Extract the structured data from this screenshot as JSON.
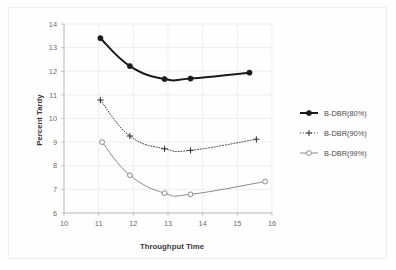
{
  "chart_data": {
    "type": "line",
    "title": "",
    "xlabel": "Throughput Time",
    "ylabel": "Percent Tardy",
    "xlim": [
      10,
      16
    ],
    "ylim": [
      6,
      14
    ],
    "xticks": [
      10,
      11,
      12,
      13,
      14,
      15,
      16
    ],
    "yticks": [
      6,
      7,
      8,
      9,
      10,
      11,
      12,
      13,
      14
    ],
    "xtick_labels": [
      "10",
      "11",
      "12",
      "13",
      "14",
      "15",
      "16"
    ],
    "ytick_labels": [
      "6",
      "7",
      "8",
      "9",
      "10",
      "11",
      "12",
      "13",
      "14"
    ],
    "grid": true,
    "legend_position": "right",
    "series": [
      {
        "name": "B-DBR(80%)",
        "marker": "filled-diamond",
        "linestyle": "solid",
        "color": "#1a1a1a",
        "linewidth": 2.0,
        "x": [
          11.05,
          11.9,
          12.9,
          13.65,
          15.35
        ],
        "y": [
          13.4,
          12.22,
          11.67,
          11.69,
          11.94
        ]
      },
      {
        "name": "B-DBR(90%)",
        "marker": "plus",
        "linestyle": "dotted",
        "color": "#3d3d3d",
        "linewidth": 1.0,
        "x": [
          11.05,
          11.9,
          12.9,
          13.65,
          15.55
        ],
        "y": [
          10.78,
          9.26,
          8.72,
          8.65,
          9.12
        ]
      },
      {
        "name": "B-DBR(99%)",
        "marker": "open-circle",
        "linestyle": "solid",
        "color": "#8a8a8a",
        "linewidth": 1.0,
        "x": [
          11.1,
          11.9,
          12.9,
          13.65,
          15.8
        ],
        "y": [
          9.0,
          7.6,
          6.84,
          6.79,
          7.33
        ]
      }
    ]
  },
  "legend": {
    "items": [
      {
        "label": "B-DBR(80%)"
      },
      {
        "label": "B-DBR(90%)"
      },
      {
        "label": "B-DBR(99%)"
      }
    ]
  },
  "axes": {
    "x_title": "Throughput Time",
    "y_title": "Percent Tardy"
  },
  "colors": {
    "series_80": "#1a1a1a",
    "series_90": "#3d3d3d",
    "series_99": "#8a8a8a",
    "grid": "#e6e6e6",
    "axis": "#b9b9b9",
    "background": "#fefefe"
  }
}
